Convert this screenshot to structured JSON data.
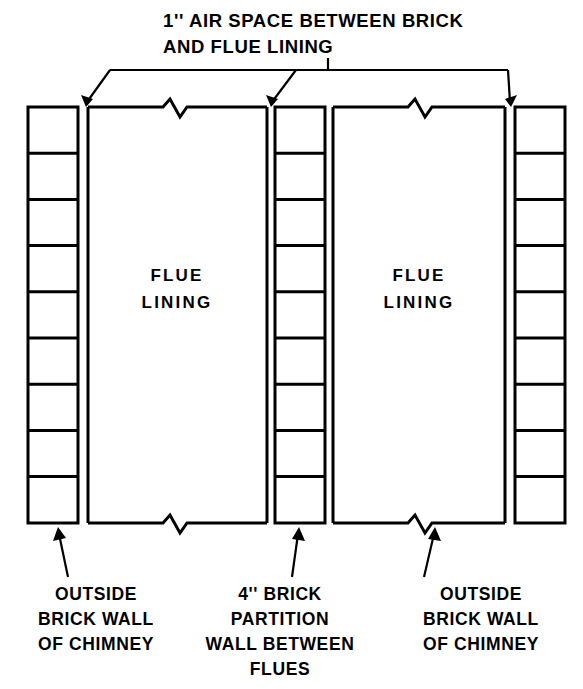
{
  "figure": {
    "title_lines": [
      "1'' AIR SPACE BETWEEN BRICK",
      "AND FLUE LINING"
    ],
    "stroke_color": "#000000",
    "background_color": "#ffffff"
  },
  "labels": {
    "top_callout": {
      "line1": "1'' AIR SPACE BETWEEN BRICK",
      "line2": "AND FLUE LINING"
    },
    "flue_left": {
      "line1": "FLUE",
      "line2": "LINING"
    },
    "flue_right": {
      "line1": "FLUE",
      "line2": "LINING"
    },
    "bottom_left": {
      "line1": "OUTSIDE",
      "line2": "BRICK WALL",
      "line3": "OF CHIMNEY"
    },
    "bottom_center": {
      "line1": "4'' BRICK",
      "line2": "PARTITION",
      "line3": "WALL BETWEEN",
      "line4": "FLUES"
    },
    "bottom_right": {
      "line1": "OUTSIDE",
      "line2": "BRICK WALL",
      "line3": "OF CHIMNEY"
    }
  },
  "geometry": {
    "brick_columns": [
      {
        "name": "outside-brick-wall-left",
        "x": 28,
        "y": 107,
        "width": 50,
        "height": 416,
        "cells": 9
      },
      {
        "name": "brick-partition-wall",
        "x": 275,
        "y": 107,
        "width": 50,
        "height": 416,
        "cells": 9
      },
      {
        "name": "outside-brick-wall-right",
        "x": 515,
        "y": 107,
        "width": 50,
        "height": 416,
        "cells": 9
      }
    ],
    "flue_linings": [
      {
        "name": "flue-lining-left",
        "x": 88,
        "y": 107,
        "width": 179,
        "height": 416
      },
      {
        "name": "flue-lining-right",
        "x": 333,
        "y": 107,
        "width": 172,
        "height": 416
      }
    ],
    "air_gaps": [
      {
        "name": "air-gap-1",
        "x": 78,
        "width": 10
      },
      {
        "name": "air-gap-2",
        "x": 267,
        "width": 8
      },
      {
        "name": "air-gap-3",
        "x": 325,
        "width": 8
      },
      {
        "name": "air-gap-4",
        "x": 505,
        "width": 10
      }
    ],
    "break_symbols": [
      {
        "name": "break-top-left-flue",
        "x": 175,
        "y": 107
      },
      {
        "name": "break-top-right-flue",
        "x": 420,
        "y": 107
      },
      {
        "name": "break-bottom-left-flue",
        "x": 175,
        "y": 523
      },
      {
        "name": "break-bottom-right-flue",
        "x": 420,
        "y": 523
      }
    ]
  },
  "counts": {
    "brick_columns": 3,
    "flue_linings": 2,
    "bricks_per_column": 9,
    "air_space_arrows": 3
  }
}
